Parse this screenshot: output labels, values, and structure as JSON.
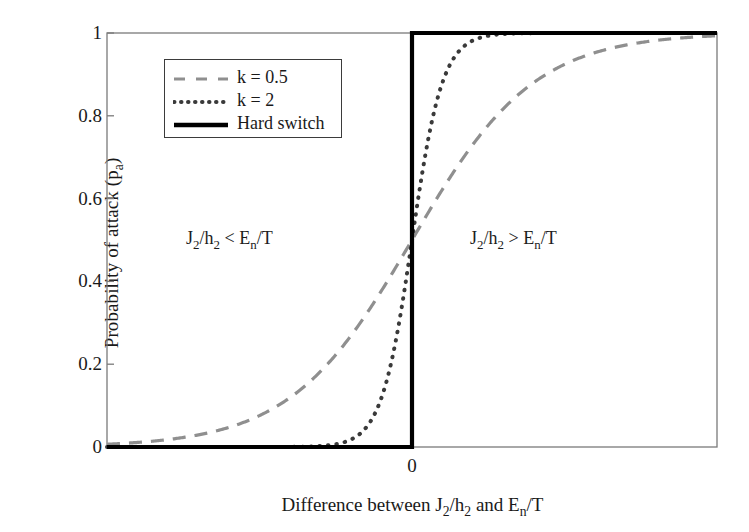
{
  "chart_data": {
    "type": "line",
    "title": "",
    "xlabel": "Difference between J2/h2 and En/T",
    "xlabel_parts": [
      {
        "t": "Difference between J",
        "sub": false
      },
      {
        "t": "2",
        "sub": true
      },
      {
        "t": "/h",
        "sub": false
      },
      {
        "t": "2",
        "sub": true
      },
      {
        "t": " and E",
        "sub": false
      },
      {
        "t": "n",
        "sub": true
      },
      {
        "t": "/T",
        "sub": false
      }
    ],
    "ylabel": "Probability of attack (pa)",
    "ylabel_parts": [
      {
        "t": "Probability of attack (p",
        "sub": false
      },
      {
        "t": "a",
        "sub": true
      },
      {
        "t": ")",
        "sub": false
      }
    ],
    "xlim": [
      -10,
      10
    ],
    "ylim": [
      0,
      1
    ],
    "grid": false,
    "legend_position": "upper-left",
    "xticks": [
      {
        "value": 0,
        "label": "0"
      }
    ],
    "yticks": [
      {
        "value": 0,
        "label": "0"
      },
      {
        "value": 0.2,
        "label": "0.2"
      },
      {
        "value": 0.4,
        "label": "0.4"
      },
      {
        "value": 0.6,
        "label": "0.6"
      },
      {
        "value": 0.8,
        "label": "0.8"
      },
      {
        "value": 1,
        "label": "1"
      }
    ],
    "series": [
      {
        "name": "k = 0.5",
        "style": "dashed",
        "color": "#8f8f8f",
        "width": 3.2,
        "dash": "13,9",
        "model": "logistic",
        "k": 0.5,
        "x0": 0,
        "x": [
          -10,
          -9,
          -8,
          -7,
          -6,
          -5,
          -4,
          -3,
          -2,
          -1,
          0,
          1,
          2,
          3,
          4,
          5,
          6,
          7,
          8,
          9,
          10
        ],
        "values": [
          0.007,
          0.011,
          0.018,
          0.029,
          0.047,
          0.076,
          0.119,
          0.182,
          0.269,
          0.378,
          0.5,
          0.622,
          0.731,
          0.818,
          0.881,
          0.924,
          0.953,
          0.971,
          0.982,
          0.989,
          0.993
        ]
      },
      {
        "name": "k = 2",
        "style": "dotted",
        "color": "#3a3a3a",
        "width": 4.0,
        "dash": "0.5,8",
        "model": "logistic",
        "k": 2,
        "x0": 0,
        "x": [
          -10,
          -9,
          -8,
          -7,
          -6,
          -5,
          -4,
          -3,
          -2,
          -1,
          0,
          1,
          2,
          3,
          4,
          5,
          6,
          7,
          8,
          9,
          10
        ],
        "values": [
          0.0,
          0.0,
          0.0,
          0.0,
          0.0,
          0.0,
          0.0003,
          0.0025,
          0.018,
          0.119,
          0.5,
          0.881,
          0.982,
          0.9975,
          0.9997,
          1.0,
          1.0,
          1.0,
          1.0,
          1.0,
          1.0
        ]
      },
      {
        "name": "Hard switch",
        "style": "solid",
        "color": "#000000",
        "width": 4.2,
        "dash": "",
        "model": "step",
        "x0": 0,
        "x": [
          -10,
          0,
          0,
          10
        ],
        "values": [
          0,
          0,
          1,
          1
        ]
      }
    ],
    "annotations": [
      {
        "id": "ann-left",
        "text": "J2/h2 < En/T",
        "parts": [
          {
            "t": "J",
            "sub": false
          },
          {
            "t": "2",
            "sub": true
          },
          {
            "t": "/h",
            "sub": false
          },
          {
            "t": "2",
            "sub": true
          },
          {
            "t": " < E",
            "sub": false
          },
          {
            "t": "n",
            "sub": true
          },
          {
            "t": "/T",
            "sub": false
          }
        ]
      },
      {
        "id": "ann-right",
        "text": "J2/h2 > En/T",
        "parts": [
          {
            "t": "J",
            "sub": false
          },
          {
            "t": "2",
            "sub": true
          },
          {
            "t": "/h",
            "sub": false
          },
          {
            "t": "2",
            "sub": true
          },
          {
            "t": " > E",
            "sub": false
          },
          {
            "t": "n",
            "sub": true
          },
          {
            "t": "/T",
            "sub": false
          }
        ]
      }
    ],
    "legend": {
      "entries": [
        {
          "label": "k = 0.5",
          "style": "dashed",
          "color": "#8f8f8f"
        },
        {
          "label": "k = 2",
          "style": "dotted",
          "color": "#3a3a3a"
        },
        {
          "label": "Hard switch",
          "style": "solid",
          "color": "#000000"
        }
      ]
    },
    "axes_frame": {
      "color": "#7a7a7a",
      "left": 107,
      "right": 717,
      "top": 33,
      "bottom": 447
    }
  }
}
